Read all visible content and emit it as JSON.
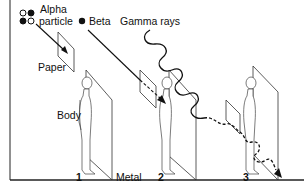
{
  "diagram": {
    "title_labels": {
      "alpha_line1": "Alpha",
      "alpha_line2": "particle",
      "beta": "Beta",
      "gamma": "Gamma rays"
    },
    "barrier_labels": {
      "paper": "Paper",
      "body": "Body",
      "metal": "Metal"
    },
    "scene_numbers": [
      "1",
      "2",
      "3"
    ],
    "colors": {
      "ink": "#111111",
      "background": "#ffffff",
      "border": "#222222"
    },
    "scenes": [
      {
        "number": "1",
        "radiation": "Alpha particle",
        "stopped_by": "Paper"
      },
      {
        "number": "2",
        "radiation": "Beta",
        "stopped_by": "Body"
      },
      {
        "number": "3",
        "radiation": "Gamma rays",
        "stopped_by": "Metal (passes through)"
      }
    ]
  }
}
